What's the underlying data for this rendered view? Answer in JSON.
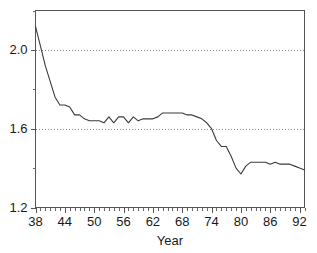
{
  "chart_data": {
    "type": "line",
    "title": "",
    "subtitle": "",
    "xlabel": "Year",
    "ylabel": "",
    "xlim": [
      38,
      93
    ],
    "ylim": [
      1.2,
      2.2
    ],
    "grid": true,
    "grid_axis": "y",
    "legend": "none",
    "x_major_ticks": [
      38,
      44,
      50,
      56,
      62,
      68,
      74,
      80,
      86,
      92
    ],
    "x_major_tick_labels": [
      "38",
      "44",
      "50",
      "56",
      "62",
      "68",
      "74",
      "80",
      "86",
      "92"
    ],
    "x_minor_tick_step": 1,
    "y_major_ticks": [
      1.2,
      1.6,
      2.0
    ],
    "y_major_tick_labels": [
      "1.2",
      "1.6",
      "2.0"
    ],
    "y_minor_ticks": [
      1.4,
      1.8,
      2.2
    ],
    "line_color": "#3b3b3b",
    "frame_color": "#555555",
    "grid_color": "#8a8a8a",
    "background_color": "#ffffff",
    "x": [
      38,
      39,
      40,
      41,
      42,
      43,
      44,
      45,
      46,
      47,
      48,
      49,
      50,
      51,
      52,
      53,
      54,
      55,
      56,
      57,
      58,
      59,
      60,
      61,
      62,
      63,
      64,
      65,
      66,
      67,
      68,
      69,
      70,
      71,
      72,
      73,
      74,
      75,
      76,
      77,
      78,
      79,
      80,
      81,
      82,
      83,
      84,
      85,
      86,
      87,
      88,
      89,
      90,
      91,
      92,
      93
    ],
    "series": [
      {
        "name": "value",
        "values": [
          2.12,
          2.02,
          1.92,
          1.84,
          1.76,
          1.72,
          1.72,
          1.71,
          1.67,
          1.67,
          1.65,
          1.64,
          1.64,
          1.64,
          1.63,
          1.66,
          1.63,
          1.66,
          1.66,
          1.63,
          1.66,
          1.64,
          1.65,
          1.65,
          1.65,
          1.66,
          1.68,
          1.68,
          1.68,
          1.68,
          1.68,
          1.67,
          1.67,
          1.66,
          1.65,
          1.63,
          1.6,
          1.54,
          1.51,
          1.51,
          1.46,
          1.4,
          1.37,
          1.41,
          1.43,
          1.43,
          1.43,
          1.43,
          1.42,
          1.43,
          1.42,
          1.42,
          1.42,
          1.41,
          1.4,
          1.39
        ]
      }
    ]
  }
}
